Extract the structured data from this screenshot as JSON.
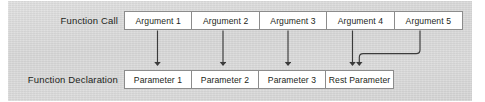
{
  "diagram": {
    "background_color": "#d4d4d4",
    "box_fill_color": "#ffffff",
    "box_border_color": "#8c8c8c",
    "arrow_color": "#3b3b3b",
    "text_color": "#231f20",
    "rows": {
      "call": {
        "label": "Function Call",
        "cells": [
          {
            "text": "Argument 1"
          },
          {
            "text": "Argument 2"
          },
          {
            "text": "Argument 3"
          },
          {
            "text": "Argument 4"
          },
          {
            "text": "Argument 5"
          }
        ]
      },
      "declaration": {
        "label": "Function Declaration",
        "cells": [
          {
            "text": "Parameter 1"
          },
          {
            "text": "Parameter 2"
          },
          {
            "text": "Parameter 3"
          },
          {
            "text": "Rest Parameter"
          }
        ]
      }
    },
    "connections": [
      {
        "name": "argument-1-to-parameter-1",
        "from": "Argument 1",
        "to": "Parameter 1",
        "style": "straight"
      },
      {
        "name": "argument-2-to-parameter-2",
        "from": "Argument 2",
        "to": "Parameter 2",
        "style": "straight"
      },
      {
        "name": "argument-3-to-parameter-3",
        "from": "Argument 3",
        "to": "Parameter 3",
        "style": "straight"
      },
      {
        "name": "argument-4-to-rest-parameter",
        "from": "Argument 4",
        "to": "Rest Parameter",
        "style": "straight"
      },
      {
        "name": "argument-5-to-rest-parameter",
        "from": "Argument 5",
        "to": "Rest Parameter",
        "style": "curved"
      }
    ]
  }
}
